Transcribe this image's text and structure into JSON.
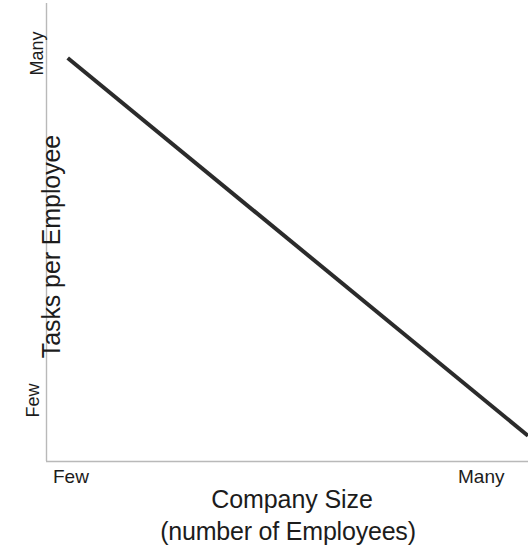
{
  "chart_data": {
    "type": "line",
    "title": "",
    "xlabel": "Company Size",
    "xlabel_sub": "(number of Employees)",
    "ylabel": "Tasks per Employee",
    "x_tick_labels": [
      "Few",
      "Many"
    ],
    "y_tick_labels": [
      "Few",
      "Many"
    ],
    "xlim": [
      "Few",
      "Many"
    ],
    "ylim": [
      "Few",
      "Many"
    ],
    "grid": false,
    "legend": false,
    "legend_position": "none",
    "annotations": [],
    "series": [
      {
        "name": "Tasks per Employee vs Company Size",
        "relationship": "negative linear",
        "x": [
          0.045,
          1.0
        ],
        "y": [
          0.88,
          0.055
        ],
        "points": [
          {
            "x_label": "Few",
            "y_label": "Many"
          },
          {
            "x_label": "Many",
            "y_label": "Few"
          }
        ],
        "color": "#2b2b2b",
        "line_width": 4
      }
    ]
  },
  "axes": {
    "line_color": "#b9b9b9",
    "line_width": 1,
    "y_axis_top_label": "Many",
    "y_axis_bottom_label": "Few",
    "x_axis_left_label": "Few",
    "x_axis_right_label": "Many"
  },
  "labels": {
    "y_title": "Tasks per Employee",
    "y_tick_top": "Many",
    "y_tick_bottom": "Few",
    "x_tick_left": "Few",
    "x_tick_right": "Many",
    "x_title_main": "Company Size",
    "x_title_sub": "(number of Employees)"
  },
  "colors": {
    "background": "#ffffff",
    "text": "#1c1c1c",
    "data_line": "#2b2b2b",
    "axis_line": "#b9b9b9"
  }
}
